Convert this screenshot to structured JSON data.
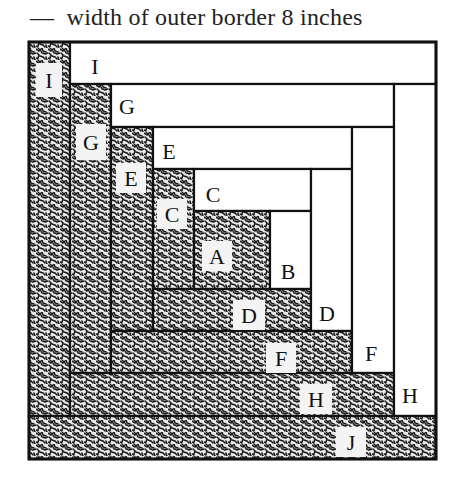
{
  "caption": {
    "dash": "—",
    "text": "width of outer border 8 inches"
  },
  "colors": {
    "line": "#111111",
    "fabric_dark": "#1a1a1a",
    "fabric_light": "#ffffff"
  },
  "diagram": {
    "type": "log-cabin-quilt-block",
    "outer": {
      "x": 29,
      "y": 42,
      "w": 407,
      "h": 417
    },
    "pieces": [
      {
        "id": "I-left",
        "label": "I",
        "fill": "dark",
        "x": 29,
        "y": 42,
        "w": 41,
        "h": 374,
        "lx": 36,
        "ly": 63,
        "lw": 26,
        "lh": 34
      },
      {
        "id": "I-top",
        "label": "I",
        "fill": "light",
        "x": 70,
        "y": 42,
        "w": 366,
        "h": 42,
        "lx": 86,
        "ly": 58,
        "lw": 0,
        "lh": 0
      },
      {
        "id": "G-left",
        "label": "G",
        "fill": "dark",
        "x": 70,
        "y": 84,
        "w": 41,
        "h": 289,
        "lx": 76,
        "ly": 124,
        "lw": 30,
        "lh": 36
      },
      {
        "id": "G-top",
        "label": "G",
        "fill": "light",
        "x": 111,
        "y": 84,
        "w": 283,
        "h": 43,
        "lx": 118,
        "ly": 98,
        "lw": 0,
        "lh": 0
      },
      {
        "id": "E-left",
        "label": "E",
        "fill": "dark",
        "x": 111,
        "y": 127,
        "w": 42,
        "h": 204,
        "lx": 116,
        "ly": 163,
        "lw": 30,
        "lh": 30
      },
      {
        "id": "E-top",
        "label": "E",
        "fill": "light",
        "x": 153,
        "y": 127,
        "w": 199,
        "h": 42,
        "lx": 160,
        "ly": 143,
        "lw": 0,
        "lh": 0
      },
      {
        "id": "C-left",
        "label": "C",
        "fill": "dark",
        "x": 153,
        "y": 169,
        "w": 41,
        "h": 120,
        "lx": 157,
        "ly": 199,
        "lw": 30,
        "lh": 30
      },
      {
        "id": "C-top",
        "label": "C",
        "fill": "light",
        "x": 194,
        "y": 169,
        "w": 117,
        "h": 42,
        "lx": 204,
        "ly": 186,
        "lw": 0,
        "lh": 0
      },
      {
        "id": "A",
        "label": "A",
        "fill": "dark",
        "x": 194,
        "y": 211,
        "w": 76,
        "h": 78,
        "lx": 202,
        "ly": 241,
        "lw": 30,
        "lh": 30
      },
      {
        "id": "B",
        "label": "B",
        "fill": "light",
        "x": 270,
        "y": 211,
        "w": 41,
        "h": 78,
        "lx": 279,
        "ly": 263,
        "lw": 0,
        "lh": 0
      },
      {
        "id": "D-bottom",
        "label": "D",
        "fill": "dark",
        "x": 153,
        "y": 289,
        "w": 158,
        "h": 42,
        "lx": 233,
        "ly": 300,
        "lw": 32,
        "lh": 30
      },
      {
        "id": "D-right",
        "label": "D",
        "fill": "light",
        "x": 311,
        "y": 169,
        "w": 41,
        "h": 162,
        "lx": 318,
        "ly": 305,
        "lw": 0,
        "lh": 0
      },
      {
        "id": "F-bottom",
        "label": "F",
        "fill": "dark",
        "x": 111,
        "y": 331,
        "w": 241,
        "h": 42,
        "lx": 266,
        "ly": 343,
        "lw": 30,
        "lh": 30
      },
      {
        "id": "F-right",
        "label": "F",
        "fill": "light",
        "x": 352,
        "y": 127,
        "w": 42,
        "h": 246,
        "lx": 362,
        "ly": 345,
        "lw": 0,
        "lh": 0
      },
      {
        "id": "H-bottom",
        "label": "H",
        "fill": "dark",
        "x": 70,
        "y": 373,
        "w": 324,
        "h": 43,
        "lx": 300,
        "ly": 384,
        "lw": 32,
        "lh": 30
      },
      {
        "id": "H-right",
        "label": "H",
        "fill": "light",
        "x": 394,
        "y": 84,
        "w": 42,
        "h": 332,
        "lx": 401,
        "ly": 387,
        "lw": 0,
        "lh": 0
      },
      {
        "id": "J-bottom",
        "label": "J",
        "fill": "dark",
        "x": 29,
        "y": 416,
        "w": 407,
        "h": 43,
        "lx": 336,
        "ly": 427,
        "lw": 30,
        "lh": 30
      }
    ]
  }
}
